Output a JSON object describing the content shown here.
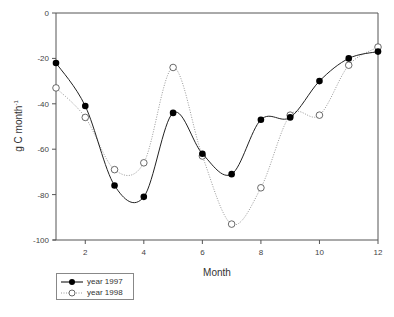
{
  "chart_data": {
    "type": "line",
    "title": "",
    "xlabel": "Month",
    "ylabel": "g C month",
    "ylabel_superscript": "-1",
    "xlim": [
      1,
      12
    ],
    "ylim": [
      -100,
      0
    ],
    "x_ticks": [
      2,
      4,
      6,
      8,
      10,
      12
    ],
    "y_ticks": [
      0,
      -20,
      -40,
      -60,
      -80,
      -100
    ],
    "grid": false,
    "legend_position": "below-left",
    "x": [
      1,
      2,
      3,
      4,
      5,
      6,
      7,
      8,
      9,
      10,
      11,
      12
    ],
    "series": [
      {
        "name": "year 1997",
        "marker": "filled-circle",
        "line": "solid",
        "color": "#000000",
        "values": [
          -22,
          -41,
          -76,
          -81,
          -44,
          -62,
          -71,
          -47,
          -46,
          -30,
          -20,
          -17
        ]
      },
      {
        "name": "year 1998",
        "marker": "open-circle",
        "line": "dotted",
        "color": "#999999",
        "values": [
          -33,
          -46,
          -69,
          -66,
          -24,
          -63,
          -93,
          -77,
          -45,
          -45,
          -23,
          -15
        ]
      }
    ]
  },
  "legend": {
    "items": [
      {
        "label": "year 1997"
      },
      {
        "label": "year 1998"
      }
    ]
  },
  "axes": {
    "xlabel": "Month",
    "ylabel_main": "g C month",
    "ylabel_sup": "-1"
  }
}
